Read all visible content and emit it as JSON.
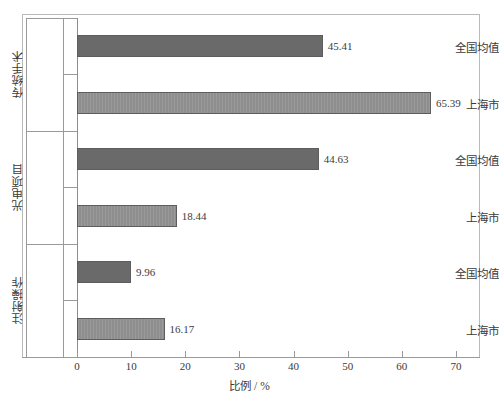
{
  "chart_data": {
    "type": "bar",
    "orientation": "horizontal",
    "title": "",
    "subtitle": "",
    "xlabel": "比例 / %",
    "ylabel": "",
    "xlim": [
      0,
      70
    ],
    "xticks": [
      0,
      10,
      20,
      30,
      40,
      50,
      60,
      70
    ],
    "xtick_labels": [
      "0",
      "10",
      "20",
      "30",
      "40",
      "50",
      "60",
      "70"
    ],
    "grid": false,
    "legend": null,
    "groups": [
      {
        "name": "传统手术",
        "categories": [
          "全国均值",
          "上海市"
        ],
        "values": [
          45.41,
          44.63
        ]
      }
    ],
    "categories": [
      "全国均值",
      "上海市",
      "全国均值",
      "上海市",
      "全国均值",
      "上海市"
    ],
    "group_labels": [
      "传统手术",
      "光电项目",
      "注射操作"
    ],
    "values": [
      45.41,
      65.39,
      44.63,
      18.44,
      9.96,
      16.17
    ],
    "bars": [
      {
        "group": "传统手术",
        "category": "全国均值",
        "value": 45.41,
        "label": "45.41",
        "style": "dark"
      },
      {
        "group": "传统手术",
        "category": "上海市",
        "value": 65.39,
        "label": "65.39",
        "style": "light"
      },
      {
        "group": "光电项目",
        "category": "全国均值",
        "value": 44.63,
        "label": "44.63",
        "style": "dark"
      },
      {
        "group": "光电项目",
        "category": "上海市",
        "value": 18.44,
        "label": "18.44",
        "style": "light"
      },
      {
        "group": "注射操作",
        "category": "全国均值",
        "value": 9.96,
        "label": "9.96",
        "style": "dark"
      },
      {
        "group": "注射操作",
        "category": "上海市",
        "value": 16.17,
        "label": "16.17",
        "style": "light"
      }
    ],
    "colors": {
      "bar_dark": "#6a6a6a",
      "bar_light": "#8e8e8e",
      "bar_border": "#5d5d5d",
      "axis": "#9a9a9a",
      "frame": "#b9b9b9",
      "text": "#3a3a3a",
      "background": "#ffffff"
    }
  }
}
